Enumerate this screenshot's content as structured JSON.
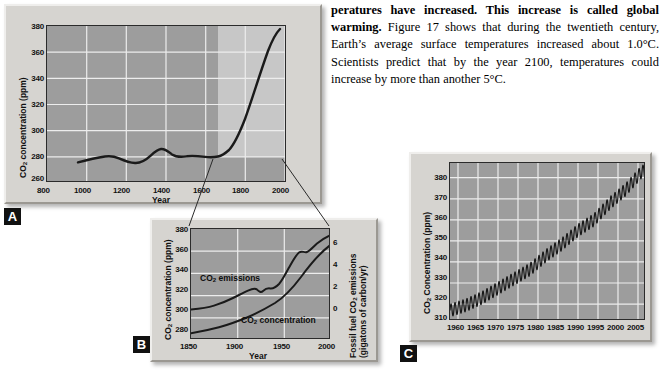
{
  "body_text": {
    "bold_lead": "peratures have increased. This increase is called global warming.",
    "rest": " Figure 17 shows that during the twentieth century, Earth’s average surface temperatures increased about 1.0°C. Scientists predict that by the year 2100, temperatures could increase by more than another 5°C."
  },
  "panels": {
    "a": {
      "letter": "A",
      "xlabel": "Year",
      "ylabel_pre": "CO",
      "ylabel_sub": "2",
      "ylabel_post": " concentration (ppm)",
      "xticks": [
        "800",
        "1000",
        "1200",
        "1400",
        "1600",
        "1800",
        "2000"
      ],
      "yticks": [
        "380",
        "360",
        "340",
        "320",
        "300",
        "280",
        "260"
      ]
    },
    "b": {
      "letter": "B",
      "xlabel": "Year",
      "ylabel_pre": "CO",
      "ylabel_sub": "2",
      "ylabel_post": " concentration (ppm)",
      "y2label_line1_pre": "Fossil fuel CO",
      "y2label_line1_sub": "2",
      "y2label_line1_post": " emissions",
      "y2label_line2": "(gigatons of carbon/yr)",
      "xticks": [
        "1850",
        "1900",
        "1950",
        "2000"
      ],
      "yticks": [
        "380",
        "360",
        "340",
        "320",
        "300",
        "280"
      ],
      "y2ticks": [
        "6",
        "4",
        "2",
        "0"
      ],
      "series_label_emissions_pre": "CO",
      "series_label_emissions_sub": "2",
      "series_label_emissions_post": " emissions",
      "series_label_concentration_pre": "CO",
      "series_label_concentration_sub": "2",
      "series_label_concentration_post": " concentration"
    },
    "c": {
      "letter": "C",
      "ylabel_pre": "CO",
      "ylabel_sub": "2",
      "ylabel_post": " Concentration (ppm)",
      "xticks": [
        "1960",
        "1965",
        "1970",
        "1975",
        "1980",
        "1985",
        "1990",
        "1995",
        "2000",
        "2005"
      ],
      "yticks": [
        "380",
        "370",
        "360",
        "350",
        "340",
        "330",
        "320",
        "310"
      ]
    }
  },
  "colors": {
    "plot_background": "#9d9d9d",
    "gridline": "#ededed",
    "curve": "#1a1a1a",
    "panel_face": "#d6d4d0",
    "highlight_box": "#c9c9c9"
  },
  "chart_data": [
    {
      "id": "A",
      "type": "line",
      "title": "",
      "xlabel": "Year",
      "ylabel": "CO2 concentration (ppm)",
      "xlim": [
        800,
        2010
      ],
      "ylim": [
        260,
        380
      ],
      "xticks": [
        800,
        1000,
        1200,
        1400,
        1600,
        1800,
        2000
      ],
      "yticks": [
        260,
        280,
        300,
        320,
        340,
        360,
        380
      ],
      "grid": true,
      "legend": "none",
      "annotation": "Light highlight box spans 1850-2005, 280-380 ppm; callout lines connect it to panel B",
      "series": [
        {
          "name": "CO2 concentration",
          "x": [
            960,
            1000,
            1050,
            1100,
            1120,
            1160,
            1200,
            1230,
            1260,
            1300,
            1340,
            1360,
            1400,
            1440,
            1480,
            1500,
            1540,
            1580,
            1620,
            1660,
            1700,
            1740,
            1760,
            1800,
            1830,
            1850,
            1880,
            1900,
            1920,
            1940,
            1960,
            1975,
            1985,
            1995,
            2005
          ],
          "values": [
            276,
            277,
            278,
            280,
            280.5,
            279,
            277.5,
            277,
            278.5,
            281,
            284.5,
            285,
            283,
            281.5,
            281,
            282,
            282,
            281.5,
            281,
            280.5,
            280,
            280,
            280.5,
            281,
            283,
            285,
            290,
            296,
            302,
            310,
            317,
            331,
            345,
            360,
            372
          ]
        }
      ]
    },
    {
      "id": "B",
      "type": "line",
      "title": "",
      "xlabel": "Year",
      "ylabel": "CO2 concentration (ppm)",
      "y2label": "Fossil fuel CO2 emissions (gigatons of carbon/yr)",
      "xlim": [
        1850,
        2000
      ],
      "ylim": [
        280,
        380
      ],
      "y2lim": [
        -1.2,
        7.0
      ],
      "xticks": [
        1850,
        1900,
        1950,
        2000
      ],
      "yticks": [
        280,
        300,
        320,
        340,
        360,
        380
      ],
      "y2ticks": [
        0,
        2,
        4,
        6
      ],
      "grid": true,
      "legend": "inline-labels",
      "series": [
        {
          "name": "CO2 concentration",
          "axis": "left",
          "x": [
            1850,
            1860,
            1870,
            1880,
            1890,
            1900,
            1910,
            1920,
            1930,
            1940,
            1950,
            1960,
            1970,
            1980,
            1990,
            2000
          ],
          "values": [
            286,
            287,
            288.5,
            290,
            292,
            295,
            298,
            301,
            305,
            308,
            311,
            316,
            325,
            338,
            352,
            366
          ]
        },
        {
          "name": "CO2 emissions",
          "axis": "right",
          "x": [
            1850,
            1860,
            1870,
            1880,
            1890,
            1900,
            1910,
            1920,
            1925,
            1930,
            1932,
            1935,
            1940,
            1945,
            1950,
            1955,
            1960,
            1965,
            1970,
            1975,
            1979,
            1982,
            1985,
            1990,
            1995,
            2000
          ],
          "values": [
            0.05,
            0.1,
            0.15,
            0.25,
            0.35,
            0.5,
            0.8,
            0.95,
            1.05,
            1.0,
            0.85,
            1.0,
            1.2,
            1.15,
            1.6,
            2.1,
            2.6,
            3.2,
            4.2,
            4.7,
            5.3,
            5.1,
            5.3,
            5.9,
            6.2,
            6.8
          ]
        }
      ]
    },
    {
      "id": "C",
      "type": "line",
      "title": "",
      "xlabel": "",
      "ylabel": "CO2 Concentration (ppm)",
      "xlim": [
        1958,
        2007
      ],
      "ylim": [
        310,
        385
      ],
      "xticks": [
        1960,
        1965,
        1970,
        1975,
        1980,
        1985,
        1990,
        1995,
        2000,
        2005
      ],
      "yticks": [
        310,
        320,
        330,
        340,
        350,
        360,
        370,
        380
      ],
      "grid": true,
      "legend": "none",
      "annotation": "Keeling curve: annual sawtooth oscillation (~6 ppm peak-to-peak) superimposed on rising trend",
      "series": [
        {
          "name": "Mauna Loa monthly mean CO2",
          "trend_x": [
            1958,
            1962,
            1966,
            1970,
            1974,
            1978,
            1982,
            1986,
            1990,
            1994,
            1998,
            2002,
            2006
          ],
          "trend_values": [
            315,
            317.5,
            321,
            325.5,
            330,
            334.5,
            341,
            346.5,
            353,
            358,
            366,
            372.5,
            381
          ],
          "seasonal_amplitude": 3.0,
          "cycles_per_year": 1
        }
      ]
    }
  ]
}
